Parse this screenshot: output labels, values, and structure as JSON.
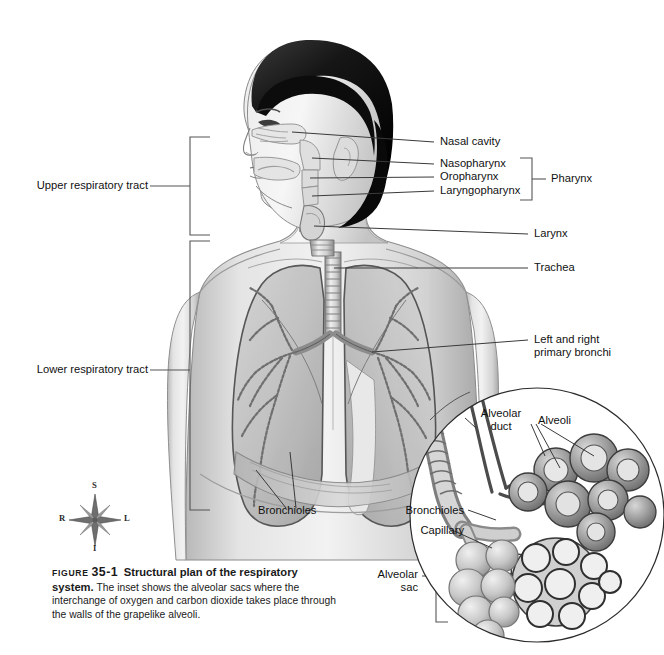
{
  "figure": {
    "title": "Structural plan of the respiratory system.",
    "figure_word": "FIGURE",
    "figure_number": "35-1",
    "caption_body": "The inset shows the alveolar sacs where the interchange of oxygen and carbon dioxide takes place through the walls of the grapelike alveoli."
  },
  "brackets": {
    "upper": "Upper respiratory tract",
    "lower": "Lower respiratory tract",
    "pharynx": "Pharynx",
    "alveolar_sac": "Alveolar\nsac"
  },
  "labels": {
    "nasal_cavity": "Nasal cavity",
    "nasopharynx": "Nasopharynx",
    "oropharynx": "Oropharynx",
    "laryngopharynx": "Laryngopharynx",
    "larynx": "Larynx",
    "trachea": "Trachea",
    "primary_bronchi": "Left and right\nprimary bronchi",
    "bronchioles_main": "Bronchioles"
  },
  "inset": {
    "alveolar_duct": "Alveolar\nduct",
    "alveoli": "Alveoli",
    "bronchioles": "Bronchioles",
    "capillary": "Capillary"
  },
  "compass": {
    "superior": "S",
    "inferior": "I",
    "right": "R",
    "left": "L"
  },
  "colors": {
    "ink": "#111111",
    "leader": "#3a3a3a",
    "bracket": "#555555",
    "background": "#ffffff"
  }
}
